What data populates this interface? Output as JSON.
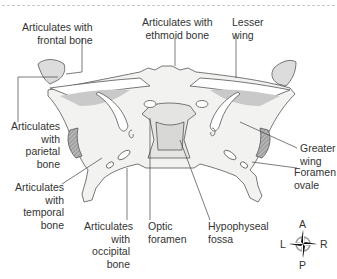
{
  "diagram": {
    "labels": {
      "frontal": [
        "Articulates with",
        "frontal bone"
      ],
      "ethmoid": [
        "Articulates with",
        "ethmoid bone"
      ],
      "lesser_wing": [
        "Lesser",
        "wing"
      ],
      "parietal": [
        "Articulates",
        "with",
        "parietal",
        "bone"
      ],
      "greater_wing": [
        "Greater",
        "wing"
      ],
      "temporal": [
        "Articulates",
        "with",
        "temporal",
        "bone"
      ],
      "foramen_ovale": [
        "Foramen",
        "ovale"
      ],
      "occipital": [
        "Articulates",
        "with",
        "occipital",
        "bone"
      ],
      "optic_foramen": [
        "Optic",
        "foramen"
      ],
      "hypophyseal_fossa": [
        "Hypophyseal",
        "fossa"
      ]
    },
    "compass": {
      "anterior": "A",
      "posterior": "P",
      "left": "L",
      "right": "R"
    },
    "colors": {
      "bone_fill": "#f2f2f0",
      "bone_shade": "#c9c9c9",
      "suture_hatch": "#a0a0a0",
      "outline": "#555555",
      "leader": "#444444",
      "text": "#333333"
    }
  }
}
